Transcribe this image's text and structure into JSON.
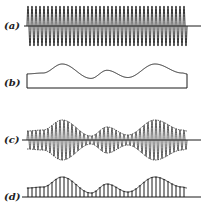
{
  "figure": {
    "ink_color": "#1a1a1a",
    "panels": [
      {
        "id": "a",
        "label": "(a)",
        "description": "unmodulated carrier wave",
        "label_x": 4,
        "label_y": 21,
        "axis_y": 26
      },
      {
        "id": "b",
        "label": "(b)",
        "description": "modulating signal",
        "label_x": 4,
        "label_y": 78,
        "axis_y": 88
      },
      {
        "id": "c",
        "label": "(c)",
        "description": "amplitude-modulated carrier",
        "label_x": 4,
        "label_y": 135,
        "axis_y": 140
      },
      {
        "id": "d",
        "label": "(d)",
        "description": "rectified modulated wave",
        "label_x": 4,
        "label_y": 192,
        "axis_y": 197
      }
    ],
    "waveform": {
      "x_start": 27,
      "x_end": 187,
      "axis_end": 201,
      "carrier_cycles": 40,
      "carrier_amplitude": 20,
      "envelope_points": [
        [
          0,
          0.45
        ],
        [
          0.1,
          0.5
        ],
        [
          0.22,
          1.0
        ],
        [
          0.4,
          0.2
        ],
        [
          0.5,
          0.65
        ],
        [
          0.63,
          0.25
        ],
        [
          0.8,
          1.0
        ],
        [
          0.97,
          0.5
        ],
        [
          1.0,
          0.45
        ]
      ]
    }
  }
}
